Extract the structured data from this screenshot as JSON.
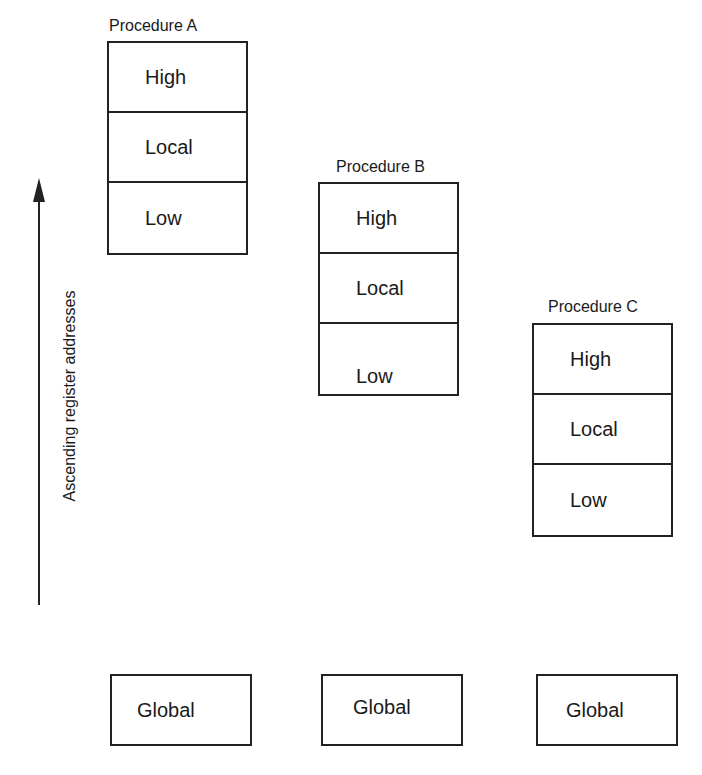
{
  "axis": {
    "label": "Ascending register addresses",
    "direction": "up"
  },
  "procedures": [
    {
      "title": "Procedure A",
      "rows": [
        "High",
        "Local",
        "Low"
      ]
    },
    {
      "title": "Procedure B",
      "rows": [
        "High",
        "Local",
        "Low"
      ]
    },
    {
      "title": "Procedure C",
      "rows": [
        "High",
        "Local",
        "Low"
      ]
    }
  ],
  "globals": [
    "Global",
    "Global",
    "Global"
  ]
}
